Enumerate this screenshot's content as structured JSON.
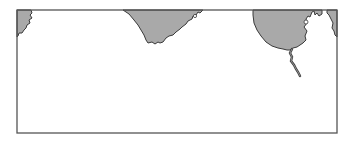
{
  "map": {
    "type": "coastline-outline-map",
    "colors": {
      "land": "#a9a9a9",
      "coast": "#3a3a3a",
      "water": "#ffffff",
      "frame": "#555555"
    },
    "regions": [
      {
        "id": "landmass-left",
        "position": "top-left corner"
      },
      {
        "id": "landmass-center",
        "position": "top center"
      },
      {
        "id": "landmass-right",
        "position": "top right",
        "has_river": true,
        "has_lake": true
      },
      {
        "id": "landmass-far-right",
        "position": "top-right corner"
      }
    ]
  }
}
